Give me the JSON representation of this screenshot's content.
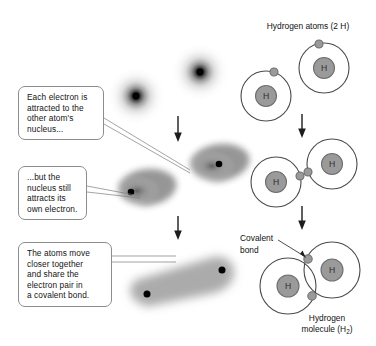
{
  "diagram": {
    "title_right": "Hydrogen atoms (2 H)",
    "bottom_label_line1": "Hydrogen",
    "bottom_label_line2_prefix": "molecule (H",
    "bottom_label_line2_sub": "2",
    "bottom_label_line2_suffix": ")",
    "covalent_label_line1": "Covalent",
    "covalent_label_line2": "bond",
    "nucleus_symbol": "H"
  },
  "callouts": [
    {
      "id": "callout-1",
      "lines": [
        "Each electron is",
        "attracted to the",
        "other atom's",
        "nucleus..."
      ]
    },
    {
      "id": "callout-2",
      "lines": [
        "...but the",
        "nucleus still",
        "attracts its",
        "own electron."
      ]
    },
    {
      "id": "callout-3",
      "lines": [
        "The atoms move",
        "closer together",
        "and share the",
        "electron pair in",
        "a covalent bond."
      ]
    }
  ],
  "stages": [
    {
      "name": "separate-atoms",
      "description": "two separate spherical electron clouds"
    },
    {
      "name": "attracting-atoms",
      "description": "two distorted teardrop electron clouds"
    },
    {
      "name": "bonded-molecule",
      "description": "merged dumbbell electron cloud"
    }
  ],
  "colors": {
    "nucleus_fill": "#9a9a9a",
    "nucleus_stroke": "#6e6e6e",
    "orbit_stroke": "#4b4b4b",
    "electron_fill": "#9a9a9a",
    "cloud_dark": "#000000",
    "callout_border": "#8d8d8d",
    "arrow": "#2a2a2a",
    "text": "#141414"
  }
}
